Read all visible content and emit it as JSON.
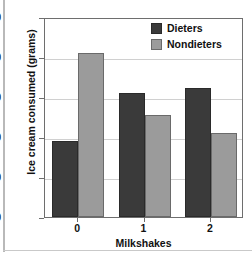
{
  "chart_data": {
    "type": "bar",
    "title": "",
    "xlabel": "Milkshakes",
    "ylabel": "Ice cream consumed (grams)",
    "categories": [
      "0",
      "1",
      "2"
    ],
    "series": [
      {
        "name": "Dieters",
        "color": "#3a3a3a",
        "values": [
          95,
          155,
          161
        ]
      },
      {
        "name": "Nondieters",
        "color": "#9b9b9b",
        "values": [
          205,
          128,
          105
        ]
      }
    ],
    "ylim": [
      0,
      250
    ],
    "yticks": [
      0,
      50,
      100,
      150,
      200,
      250
    ],
    "ytick_labels": [
      "0",
      "50",
      "100",
      "150",
      "200",
      "250"
    ],
    "grid": true,
    "legend_position": "top-right"
  }
}
